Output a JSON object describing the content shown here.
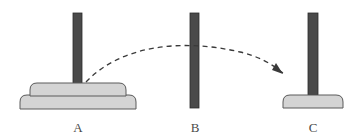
{
  "figure": {
    "name": "tower-of-hanoi-move-diagram",
    "background_color": "#ffffff",
    "width": 356,
    "height": 136
  },
  "colors": {
    "peg_fill": "#4a4a4a",
    "peg_stroke": "#2b2b2b",
    "disc_fill": "#d4d4d4",
    "disc_stroke": "#5a5a5a",
    "arrow_color": "#3a3a3a",
    "label_color": "#4a4a4a",
    "background": "#ffffff"
  },
  "pegs": [
    {
      "id": "A",
      "label": "A",
      "label_x": 78,
      "label_y": 132,
      "peg": {
        "x": 73,
        "y": 13,
        "width": 9,
        "height": 82
      },
      "discs": [
        {
          "index": 0,
          "size": "large",
          "cx": 78,
          "top": 95,
          "half_width": 58,
          "height": 14,
          "corner_radius": 7
        },
        {
          "index": 1,
          "size": "medium",
          "cx": 78,
          "top": 83,
          "half_width": 48,
          "height": 13,
          "corner_radius": 7
        }
      ],
      "disc_count": 2
    },
    {
      "id": "B",
      "label": "B",
      "label_x": 195,
      "label_y": 132,
      "peg": {
        "x": 190,
        "y": 13,
        "width": 9,
        "height": 95
      },
      "discs": [],
      "disc_count": 0
    },
    {
      "id": "C",
      "label": "C",
      "label_x": 313,
      "label_y": 132,
      "peg": {
        "x": 308,
        "y": 13,
        "width": 10,
        "height": 82
      },
      "discs": [
        {
          "index": 0,
          "size": "small",
          "cx": 313,
          "top": 95,
          "half_width": 30,
          "height": 13,
          "corner_radius": 7
        }
      ],
      "disc_count": 1
    }
  ],
  "move_arrow": {
    "name": "move-arc-a-to-c",
    "style": "dashed",
    "dash_pattern": "5 4",
    "stroke_width": 1.3,
    "path": "M 86,82 C 120,46 180,38 240,52 C 258,56 272,64 283,73",
    "from_peg": "A",
    "to_peg": "C",
    "arrowhead": {
      "points": "283,74 272,70 276,63",
      "filled": true
    }
  }
}
